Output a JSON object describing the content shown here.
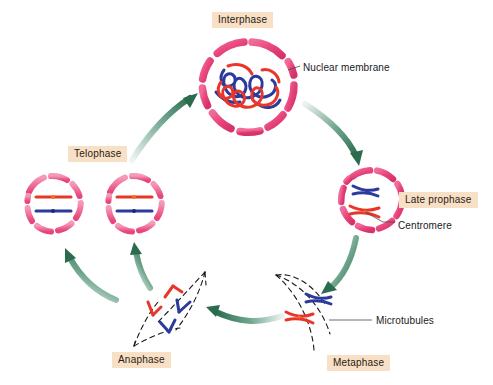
{
  "diagram": {
    "background_color": "#ffffff",
    "label_box_color": "#f7e0c6",
    "label_text_color": "#2b1a10",
    "arrow_color": "#2f7d5a",
    "membrane_color": "#e8457c",
    "chromosome_colors": {
      "blue": "#2b2f8f",
      "red": "#e8362a",
      "orange": "#f07020"
    },
    "spindle_color": "#1a1a1a"
  },
  "stages": [
    {
      "id": "interphase",
      "label": "Interphase"
    },
    {
      "id": "late_prophase",
      "label": "Late prophase"
    },
    {
      "id": "metaphase",
      "label": "Metaphase"
    },
    {
      "id": "anaphase",
      "label": "Anaphase"
    },
    {
      "id": "telophase",
      "label": "Telophase"
    }
  ],
  "annotations": [
    {
      "id": "nuclear_membrane",
      "label": "Nuclear membrane",
      "points_to": "interphase"
    },
    {
      "id": "centromere",
      "label": "Centromere",
      "points_to": "late_prophase"
    },
    {
      "id": "microtubules",
      "label": "Microtubules",
      "points_to": "metaphase"
    }
  ],
  "cells": {
    "interphase": {
      "membrane": "segmented-pink-ring",
      "contents": "tangled blue and red chromatin threads"
    },
    "late_prophase": {
      "membrane": "segmented-pink-ring",
      "contents": "two condensed X-shaped chromosomes, one blue one red"
    },
    "metaphase": {
      "membrane": "dashed-spindle-lens",
      "contents": "blue and red X-shaped chromosomes aligned at equator"
    },
    "anaphase": {
      "membrane": "dashed-spindle-lens",
      "contents": "separated V-shaped red and blue chromatids migrating to poles"
    },
    "telophase": {
      "membrane": "segmented-pink-ring",
      "contents": "one red and one blue rod chromosome with centromere dot",
      "cell_count": 2
    }
  },
  "flow": [
    {
      "from": "telophase",
      "to": "interphase"
    },
    {
      "from": "interphase",
      "to": "late_prophase"
    },
    {
      "from": "late_prophase",
      "to": "metaphase"
    },
    {
      "from": "metaphase",
      "to": "anaphase"
    },
    {
      "from": "anaphase",
      "to": "telophase"
    }
  ]
}
